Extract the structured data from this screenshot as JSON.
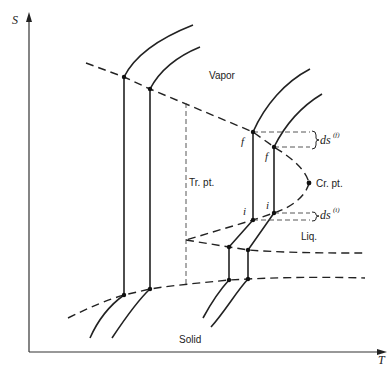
{
  "diagram": {
    "type": "entropy-temperature phase diagram",
    "axes": {
      "y_label": "S",
      "x_label": "T"
    },
    "regions": {
      "vapor": "Vapor",
      "liquid": "Liq.",
      "solid": "Solid"
    },
    "points": {
      "triple_point": "Tr. pt.",
      "critical_point": "Cr. pt."
    },
    "markers": {
      "f1": "f",
      "f2": "f",
      "i1": "i",
      "i2": "i"
    },
    "annotations": {
      "ds_f_base": "ds",
      "ds_f_sup": "(f)",
      "ds_i_base": "ds",
      "ds_i_sup": "(i)"
    },
    "colors": {
      "ink": "#222222",
      "background": "#ffffff"
    }
  }
}
